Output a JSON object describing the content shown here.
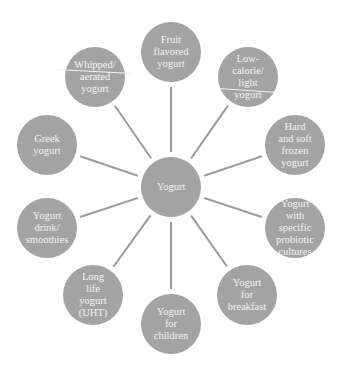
{
  "diagram": {
    "type": "hub-and-spoke",
    "colors": {
      "node_fill": "#a3a3a3",
      "spoke": "#9c9c9c",
      "text": "#f4f4f4",
      "background": "#ffffff"
    },
    "center": {
      "label": "Yogurt",
      "cx": 171,
      "cy": 187,
      "r": 30
    },
    "nodes": [
      {
        "id": "fruit",
        "label": "Fruit\nflavored\nyogurt",
        "cx": 171,
        "cy": 52,
        "r": 30
      },
      {
        "id": "low-calorie",
        "label": "Low-\ncalorie/\nlight\nyogurt",
        "cx": 248,
        "cy": 77,
        "r": 30,
        "divider_line": true
      },
      {
        "id": "frozen",
        "label": "Hard\nand soft\nfrozen\nyogurt",
        "cx": 295,
        "cy": 145,
        "r": 30
      },
      {
        "id": "probiotic",
        "label": "Yogurt\nwith\nspecific\nprobiotic\ncultures",
        "cx": 295,
        "cy": 228,
        "r": 30
      },
      {
        "id": "breakfast",
        "label": "Yogurt\nfor\nbreakfast",
        "cx": 247,
        "cy": 295,
        "r": 30
      },
      {
        "id": "children",
        "label": "Yogurt\nfor\nchildren",
        "cx": 171,
        "cy": 324,
        "r": 30
      },
      {
        "id": "long-life",
        "label": "Long\nlife\nyogurt\n(UHT)",
        "cx": 93,
        "cy": 295,
        "r": 30
      },
      {
        "id": "drink",
        "label": "Yogurt\ndrink/\nsmoothies",
        "cx": 47,
        "cy": 228,
        "r": 30
      },
      {
        "id": "greek",
        "label": "Greek\nyogurt",
        "cx": 47,
        "cy": 145,
        "r": 30
      },
      {
        "id": "whipped",
        "label": "Whipped/\naerated\nyogurt",
        "cx": 95,
        "cy": 77,
        "r": 30,
        "divider_line": true
      }
    ]
  }
}
